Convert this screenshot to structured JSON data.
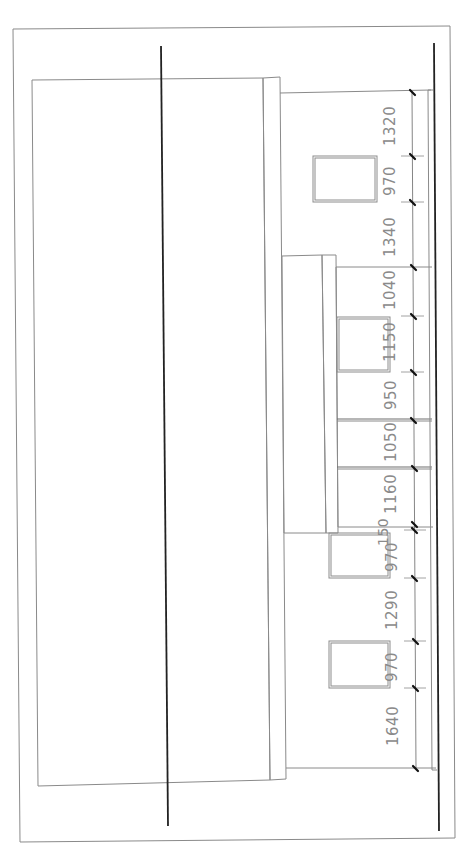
{
  "drawing": {
    "type": "architectural-elevation",
    "orientation": "rotated-90-ccw",
    "line_color": "#8a8a8a",
    "heavy_line_color": "#222222",
    "label_color": "#8a8a8a"
  },
  "dimensions": {
    "segments": [
      {
        "label": "1320",
        "from_y": 92,
        "to_y": 156,
        "label_y": 146,
        "label_x": 383
      },
      {
        "label": "970",
        "from_y": 156,
        "to_y": 202,
        "label_y": 196,
        "label_x": 383
      },
      {
        "label": "1340",
        "from_y": 202,
        "to_y": 267,
        "label_y": 257,
        "label_x": 383
      },
      {
        "label": "1040",
        "from_y": 267,
        "to_y": 316,
        "label_y": 310,
        "label_x": 383
      },
      {
        "label": "1150",
        "from_y": 316,
        "to_y": 372,
        "label_y": 362,
        "label_x": 383
      },
      {
        "label": "950",
        "from_y": 372,
        "to_y": 420,
        "label_y": 410,
        "label_x": 383
      },
      {
        "label": "1050",
        "from_y": 420,
        "to_y": 468,
        "label_y": 462,
        "label_x": 383
      },
      {
        "label": "1160",
        "from_y": 468,
        "to_y": 524,
        "label_y": 514,
        "label_x": 383
      },
      {
        "label": "150",
        "from_y": 524,
        "to_y": 530,
        "label_y": 544,
        "label_x": 376
      },
      {
        "label": "970",
        "from_y": 530,
        "to_y": 578,
        "label_y": 571,
        "label_x": 385
      },
      {
        "label": "1290",
        "from_y": 578,
        "to_y": 641,
        "label_y": 628,
        "label_x": 385
      },
      {
        "label": "970",
        "from_y": 641,
        "to_y": 688,
        "label_y": 681,
        "label_x": 385
      },
      {
        "label": "1640",
        "from_y": 688,
        "to_y": 768,
        "label_y": 745,
        "label_x": 386
      }
    ],
    "total_label_count": 13
  },
  "windows": [
    {
      "name": "window-1",
      "x": 313,
      "y": 156,
      "w": 64,
      "h": 46
    },
    {
      "name": "window-2",
      "x": 337,
      "y": 317,
      "w": 53,
      "h": 55
    },
    {
      "name": "window-3",
      "x": 329,
      "y": 533,
      "w": 61,
      "h": 45
    },
    {
      "name": "window-4",
      "x": 329,
      "y": 641,
      "w": 61,
      "h": 47
    }
  ]
}
